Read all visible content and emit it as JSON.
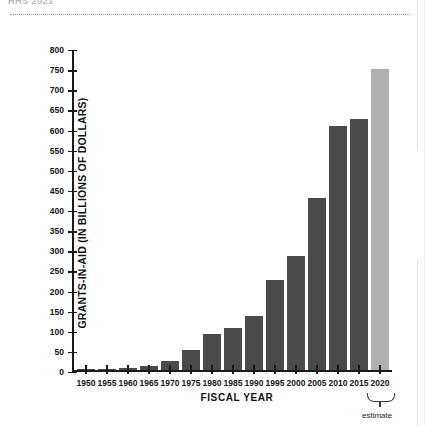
{
  "page": {
    "clipped_headline": "HHS 2021"
  },
  "chart_data": {
    "type": "bar",
    "title": "",
    "xlabel": "FISCAL YEAR",
    "ylabel": "GRANTS-IN-AID (IN BILLIONS OF DOLLARS)",
    "categories": [
      "1950",
      "1955",
      "1960",
      "1965",
      "1970",
      "1975",
      "1980",
      "1985",
      "1990",
      "1995",
      "2000",
      "2005",
      "2010",
      "2015",
      "2020"
    ],
    "values": [
      2,
      3,
      7,
      11,
      24,
      50,
      91,
      106,
      135,
      225,
      285,
      428,
      608,
      624,
      750
    ],
    "ylim": [
      0,
      800
    ],
    "yticks": [
      0,
      50,
      100,
      150,
      200,
      250,
      300,
      350,
      400,
      450,
      500,
      550,
      600,
      650,
      700,
      750,
      800
    ],
    "grid": false,
    "legend": "none",
    "annotations": [
      {
        "text": "estimate",
        "applies_to": "2020",
        "marker": "curly-brace"
      }
    ],
    "series_colors": {
      "actual": "#4a4a4a",
      "estimate": "#b0b0b0"
    },
    "estimate_categories": [
      "2020"
    ]
  }
}
